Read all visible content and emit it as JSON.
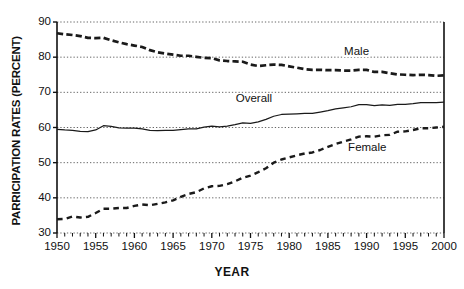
{
  "chart_data": {
    "type": "line",
    "title": "",
    "xlabel": "YEAR",
    "ylabel": "PARRICIPATION RATES (PERCENT)",
    "xlim": [
      1950,
      2000
    ],
    "ylim": [
      30,
      90
    ],
    "grid": "horizontal-dotted",
    "legend_position": "inline-annotations",
    "x_ticks": [
      "1950",
      "1955",
      "1960",
      "1965",
      "1970",
      "1975",
      "1980",
      "1985",
      "1990",
      "1995",
      "2000"
    ],
    "x_tick_values": [
      1950,
      1955,
      1960,
      1965,
      1970,
      1975,
      1980,
      1985,
      1990,
      1995,
      2000
    ],
    "x_minor_tick_interval": 1,
    "y_ticks": [
      "30",
      "40",
      "50",
      "60",
      "70",
      "80",
      "90"
    ],
    "y_tick_values": [
      30,
      40,
      50,
      60,
      70,
      80,
      90
    ],
    "x": [
      1950,
      1951,
      1952,
      1953,
      1954,
      1955,
      1956,
      1957,
      1958,
      1959,
      1960,
      1961,
      1962,
      1963,
      1964,
      1965,
      1966,
      1967,
      1968,
      1969,
      1970,
      1971,
      1972,
      1973,
      1974,
      1975,
      1976,
      1977,
      1978,
      1979,
      1980,
      1981,
      1982,
      1983,
      1984,
      1985,
      1986,
      1987,
      1988,
      1989,
      1990,
      1991,
      1992,
      1993,
      1994,
      1995,
      1996,
      1997,
      1998,
      1999,
      2000
    ],
    "series": [
      {
        "name": "Male",
        "style": "heavy-dashed",
        "color": "#1a1a1a",
        "label_text": "Male",
        "values": [
          86.8,
          86.5,
          86.3,
          86.0,
          85.5,
          85.4,
          85.5,
          84.8,
          84.2,
          83.7,
          83.3,
          82.9,
          82.0,
          81.4,
          81.0,
          80.7,
          80.4,
          80.4,
          80.1,
          79.8,
          79.7,
          79.1,
          78.9,
          78.8,
          78.7,
          77.9,
          77.5,
          77.7,
          77.9,
          77.8,
          77.4,
          77.0,
          76.6,
          76.4,
          76.4,
          76.3,
          76.3,
          76.2,
          76.2,
          76.4,
          76.4,
          75.8,
          75.8,
          75.4,
          75.1,
          75.0,
          74.9,
          75.0,
          74.9,
          74.7,
          74.8
        ]
      },
      {
        "name": "Overall",
        "style": "solid-thin",
        "color": "#1a1a1a",
        "label_text": "Overall",
        "values": [
          59.5,
          59.3,
          59.2,
          58.9,
          58.8,
          59.3,
          60.5,
          60.3,
          59.9,
          59.8,
          59.8,
          59.6,
          59.2,
          59.1,
          59.2,
          59.2,
          59.4,
          59.6,
          59.6,
          60.1,
          60.4,
          60.2,
          60.4,
          60.8,
          61.3,
          61.2,
          61.6,
          62.3,
          63.2,
          63.7,
          63.8,
          63.9,
          64.0,
          64.0,
          64.4,
          64.8,
          65.3,
          65.6,
          65.9,
          66.5,
          66.5,
          66.2,
          66.4,
          66.3,
          66.6,
          66.6,
          66.8,
          67.1,
          67.1,
          67.1,
          67.2
        ]
      },
      {
        "name": "Female",
        "style": "dashed",
        "color": "#1a1a1a",
        "label_text": "Female",
        "values": [
          33.9,
          34.0,
          34.7,
          34.4,
          34.6,
          35.7,
          36.9,
          36.9,
          37.1,
          37.1,
          37.7,
          38.1,
          37.9,
          38.3,
          38.7,
          39.3,
          40.3,
          41.1,
          41.6,
          42.7,
          43.3,
          43.4,
          43.9,
          44.7,
          45.7,
          46.3,
          47.3,
          48.4,
          50.0,
          50.9,
          51.5,
          52.1,
          52.6,
          52.9,
          53.6,
          54.5,
          55.3,
          56.0,
          56.6,
          57.4,
          57.5,
          57.4,
          57.8,
          57.9,
          58.8,
          58.9,
          59.3,
          59.8,
          59.8,
          60.0,
          60.2
        ]
      }
    ]
  },
  "axes": {
    "y_title": "PARRICIPATION RATES (PERCENT)",
    "x_title": "YEAR"
  },
  "annotations": {
    "male": "Male",
    "overall": "Overall",
    "female": "Female"
  }
}
